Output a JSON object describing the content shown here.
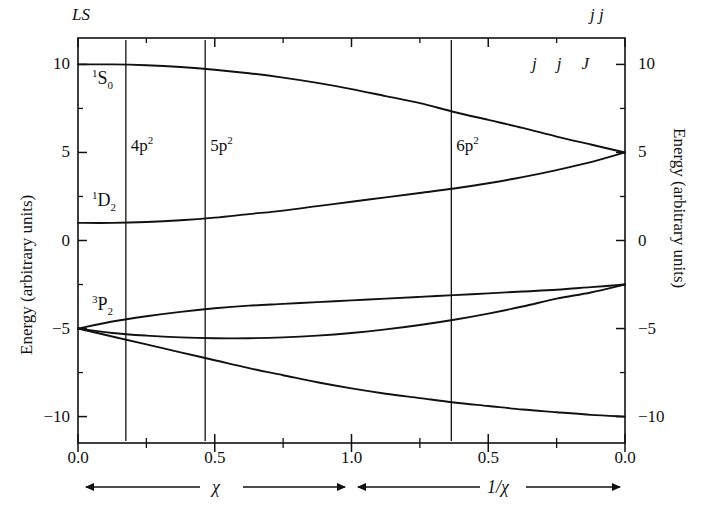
{
  "figure": {
    "left_coupling_label": "LS",
    "right_coupling_label": "j j",
    "y_axis_label_left": "Energy (arbitrary units)",
    "y_axis_label_right": "Energy (arbitrary units)",
    "x_axis_label_left": "χ",
    "x_axis_label_right": "1/χ"
  },
  "axes": {
    "y_ticks": [
      "10",
      "5",
      "0",
      "-5",
      "-10"
    ],
    "y_tick_values": [
      10,
      5,
      0,
      -5,
      -10
    ],
    "y_minor_values": [
      7.5,
      2.5,
      -2.5,
      -7.5
    ],
    "ylim": [
      -11.5,
      11.5
    ],
    "x_ticks_left": [
      "0.0",
      "0.5",
      "1.0"
    ],
    "x_tick_values_left": [
      0.0,
      0.5,
      1.0
    ],
    "x_minor_left": [
      0.25,
      0.75
    ],
    "x_ticks_right": [
      "0.5",
      "0.0"
    ],
    "x_tick_values_right": [
      0.5,
      0.0
    ],
    "x_minor_right": [
      0.75,
      0.25
    ]
  },
  "element_markers": [
    {
      "name": "Ge",
      "config": "4p",
      "config_sup": "2",
      "chi": 0.175
    },
    {
      "name": "Sn",
      "config": "5p",
      "config_sup": "2",
      "chi": 0.465
    },
    {
      "name": "Pb",
      "config": "6p",
      "config_sup": "2",
      "inv_chi": 0.635
    }
  ],
  "ls_terms": [
    {
      "label_pre": "1",
      "label_main": "S",
      "label_post": "0",
      "energy": 10
    },
    {
      "label_pre": "1",
      "label_main": "D",
      "label_post": "2",
      "energy": 1
    },
    {
      "label_pre": "3",
      "label_main": "P",
      "label_post": "2",
      "energy": -5
    }
  ],
  "ls_sub_labels": [
    {
      "text": "1",
      "energy": -5
    },
    {
      "text": "0",
      "energy": -5
    }
  ],
  "jj_header": {
    "j1": "j",
    "j2": "j",
    "J": "J"
  },
  "jj_states": [
    {
      "label": "3/2 3/2 0",
      "energy": 5
    },
    {
      "label": "3/2 3/2 2",
      "energy": 5
    },
    {
      "label": "3/2 1/2 2",
      "energy": -2.5
    },
    {
      "label": "3/2 1/2 1",
      "energy": -2.5
    },
    {
      "label": "1/2 1/2 0",
      "energy": -10
    }
  ],
  "chart_data": {
    "type": "line",
    "title": "",
    "xlabel": "χ  |  1/χ",
    "ylabel": "Energy (arbitrary units)",
    "ylim": [
      -11.5,
      11.5
    ],
    "grid": false,
    "legend": "inline-annotations",
    "x_left_domain": [
      0.0,
      1.0
    ],
    "x_right_domain": [
      1.0,
      0.0
    ],
    "note": "Left panel abscissa is chi from 0.0 to 1.0; right panel abscissa is 1/chi from 1.0 down to 0.0. Curves correlate LS-coupling terms (left, chi=0) with jj-coupling states (right, 1/chi=0).",
    "series": [
      {
        "name": "1S0 -> 3/2 3/2 0",
        "ls_term": "1S0",
        "jj_state": "3/2 3/2 0",
        "x": [
          0.0,
          0.125,
          0.25,
          0.375,
          0.5,
          0.625,
          0.75,
          0.875,
          1.0,
          1.125,
          1.25,
          1.375,
          1.5,
          1.625,
          1.75,
          1.875,
          2.0
        ],
        "values": [
          10.0,
          10.0,
          9.95,
          9.85,
          9.7,
          9.5,
          9.25,
          8.95,
          8.6,
          8.2,
          7.8,
          7.3,
          6.85,
          6.4,
          5.9,
          5.45,
          5.0
        ]
      },
      {
        "name": "1D2 -> 3/2 3/2 2",
        "ls_term": "1D2",
        "jj_state": "3/2 3/2 2",
        "x": [
          0.0,
          0.125,
          0.25,
          0.375,
          0.5,
          0.625,
          0.75,
          0.875,
          1.0,
          1.125,
          1.25,
          1.375,
          1.5,
          1.625,
          1.75,
          1.875,
          2.0
        ],
        "values": [
          1.0,
          1.0,
          1.05,
          1.15,
          1.3,
          1.5,
          1.7,
          1.95,
          2.2,
          2.45,
          2.7,
          2.95,
          3.25,
          3.6,
          4.0,
          4.45,
          5.0
        ]
      },
      {
        "name": "3P2 -> 3/2 1/2 2",
        "ls_term": "3P2",
        "jj_state": "3/2 1/2 2",
        "x": [
          0.0,
          0.125,
          0.25,
          0.375,
          0.5,
          0.625,
          0.75,
          0.875,
          1.0,
          1.125,
          1.25,
          1.375,
          1.5,
          1.625,
          1.75,
          1.875,
          2.0
        ],
        "values": [
          -5.0,
          -4.6,
          -4.3,
          -4.05,
          -3.85,
          -3.7,
          -3.6,
          -3.5,
          -3.4,
          -3.3,
          -3.2,
          -3.1,
          -3.0,
          -2.9,
          -2.8,
          -2.65,
          -2.5
        ]
      },
      {
        "name": "3P1 -> 3/2 1/2 1",
        "ls_term": "3P1",
        "jj_state": "3/2 1/2 1",
        "x": [
          0.0,
          0.125,
          0.25,
          0.375,
          0.5,
          0.625,
          0.75,
          0.875,
          1.0,
          1.125,
          1.25,
          1.375,
          1.5,
          1.625,
          1.75,
          1.875,
          2.0
        ],
        "values": [
          -5.0,
          -5.25,
          -5.4,
          -5.5,
          -5.55,
          -5.55,
          -5.5,
          -5.4,
          -5.25,
          -5.05,
          -4.8,
          -4.5,
          -4.15,
          -3.75,
          -3.3,
          -2.95,
          -2.5
        ]
      },
      {
        "name": "3P0 -> 1/2 1/2 0",
        "ls_term": "3P0",
        "jj_state": "1/2 1/2 0",
        "x": [
          0.0,
          0.125,
          0.25,
          0.375,
          0.5,
          0.625,
          0.75,
          0.875,
          1.0,
          1.125,
          1.25,
          1.375,
          1.5,
          1.625,
          1.75,
          1.875,
          2.0
        ],
        "values": [
          -5.0,
          -5.45,
          -5.9,
          -6.35,
          -6.8,
          -7.25,
          -7.65,
          -8.05,
          -8.4,
          -8.7,
          -8.95,
          -9.2,
          -9.4,
          -9.6,
          -9.75,
          -9.9,
          -10.0
        ]
      }
    ]
  }
}
